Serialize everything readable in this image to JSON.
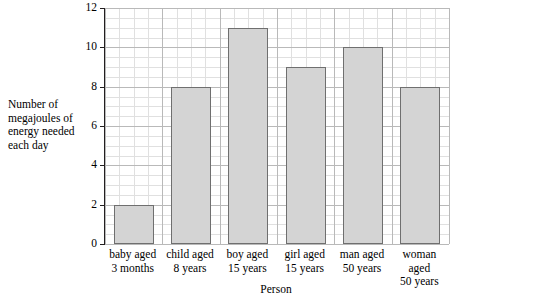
{
  "chart_data": {
    "type": "bar",
    "title": "",
    "xlabel": "Person",
    "ylabel": "Number of megajoules of energy needed each day",
    "categories": [
      "baby aged 3 months",
      "child aged 8 years",
      "boy aged 15 years",
      "girl aged 15 years",
      "man aged 50 years",
      "woman aged 50 years"
    ],
    "category_lines": [
      [
        "baby aged",
        "3 months"
      ],
      [
        "child aged",
        "8 years"
      ],
      [
        "boy aged",
        "15 years"
      ],
      [
        "girl aged",
        "15 years"
      ],
      [
        "man aged",
        "50 years"
      ],
      [
        "woman aged",
        "50 years"
      ]
    ],
    "values": [
      2,
      8,
      11,
      9,
      10,
      8
    ],
    "ylim": [
      0,
      12
    ],
    "y_ticks": [
      0,
      2,
      4,
      6,
      8,
      10,
      12
    ],
    "y_tick_labels": [
      "0",
      "2",
      "4",
      "6",
      "8",
      "10",
      "12"
    ],
    "grid": true,
    "grid_minor": true,
    "legend": "none",
    "bar_fill": "#d4d4d4",
    "bar_stroke": "#6f6f6f",
    "axis_color": "#231f20",
    "grid_major_color": "#b9b9b9",
    "grid_minor_color": "#e0e0e0"
  },
  "axes": {
    "y_title_lines": [
      "Number of",
      "megajoules of",
      "energy needed",
      "each day"
    ],
    "x_title": "Person"
  }
}
